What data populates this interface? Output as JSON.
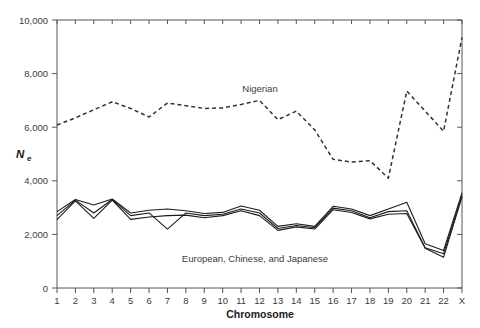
{
  "chart_data": {
    "type": "line",
    "title": "",
    "xlabel": "Chromosome",
    "ylabel": "Ne",
    "ylabel_main": "N",
    "ylabel_sub": "e",
    "categories": [
      "1",
      "2",
      "3",
      "4",
      "5",
      "6",
      "7",
      "8",
      "9",
      "10",
      "11",
      "12",
      "13",
      "14",
      "15",
      "16",
      "17",
      "18",
      "19",
      "20",
      "21",
      "22",
      "X"
    ],
    "ylim": [
      0,
      10000
    ],
    "yticks": [
      0,
      2000,
      4000,
      6000,
      8000,
      10000
    ],
    "ytick_labels": [
      "0",
      "2,000",
      "4,000",
      "6,000",
      "8,000",
      "10,000"
    ],
    "grid": false,
    "legend_position": "inline-annotation",
    "annotations": [
      {
        "name": "nigerian-label",
        "text": "Nigerian",
        "x_category": "11",
        "y_value": 7450
      },
      {
        "name": "eurasian-label",
        "text": "European, Chinese, and Japanese",
        "x_category": "9",
        "y_value": 1750
      }
    ],
    "series": [
      {
        "name": "Nigerian",
        "style": "dashed",
        "color": "#333333",
        "values": [
          6080,
          6350,
          6600,
          6900,
          6750,
          6420,
          6900,
          6750,
          6720,
          6730,
          6800,
          7000,
          7020,
          6900,
          6250,
          6150,
          6800,
          5900,
          5750,
          5550,
          4850,
          4600,
          4150
        ]
      },
      {
        "name": "European",
        "style": "solid",
        "color": "#1c1c1c",
        "values": [
          2850,
          3300,
          3100,
          3320,
          2800,
          2900,
          2950,
          2880,
          2780,
          2820,
          3060,
          2900,
          2300,
          2400,
          2300,
          3050,
          2950,
          2700,
          2950,
          3200,
          1650,
          1400,
          3550
        ]
      },
      {
        "name": "Chinese",
        "style": "solid",
        "color": "#1c1c1c",
        "values": [
          2700,
          3280,
          2800,
          3300,
          2700,
          2800,
          2200,
          2800,
          2700,
          2750,
          2950,
          2800,
          2220,
          2330,
          2250,
          2980,
          2880,
          2620,
          2850,
          2880,
          1500,
          1280,
          3450
        ]
      },
      {
        "name": "Japanese",
        "style": "solid",
        "color": "#1c1c1c",
        "values": [
          2550,
          3250,
          2600,
          3280,
          2560,
          2650,
          2700,
          2720,
          2620,
          2700,
          2880,
          2700,
          2150,
          2280,
          2200,
          2920,
          2820,
          2580,
          2750,
          2780,
          1480,
          1150,
          3400
        ]
      }
    ],
    "nigerian_extra": {
      "note": "Nigerian series continues past chromosome 22 to X",
      "values_full": [
        6080,
        6350,
        6600,
        6900,
        6750,
        6420,
        6900,
        6750,
        6720,
        6730,
        6800,
        7000,
        7020,
        6900,
        6250,
        6150,
        6800,
        5900,
        5750,
        5550,
        4850,
        4600,
        4150
      ]
    }
  },
  "nigerian_points": [
    {
      "c": "1",
      "v": 6080
    },
    {
      "c": "2",
      "v": 6350
    },
    {
      "c": "3",
      "v": 6650
    },
    {
      "c": "4",
      "v": 6950
    },
    {
      "c": "5",
      "v": 6700
    },
    {
      "c": "6",
      "v": 6380
    },
    {
      "c": "7",
      "v": 6900
    },
    {
      "c": "8",
      "v": 6800
    },
    {
      "c": "9",
      "v": 6700
    },
    {
      "c": "10",
      "v": 6720
    },
    {
      "c": "11",
      "v": 6850
    },
    {
      "c": "12",
      "v": 7000
    },
    {
      "c": "13",
      "v": 6280
    },
    {
      "c": "14",
      "v": 6600
    },
    {
      "c": "15",
      "v": 5900
    },
    {
      "c": "16",
      "v": 4800
    },
    {
      "c": "17",
      "v": 4700
    },
    {
      "c": "18",
      "v": 4750
    },
    {
      "c": "19",
      "v": 4100
    },
    {
      "c": "20",
      "v": 7350
    },
    {
      "c": "21",
      "v": 6600
    },
    {
      "c": "22",
      "v": 5850
    },
    {
      "c": "X",
      "v": 9350
    }
  ]
}
